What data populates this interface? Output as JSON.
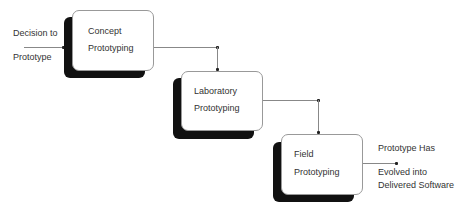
{
  "diagram": {
    "input_label_line1": "Decision to",
    "input_label_line2": "Prototype",
    "stages": [
      {
        "line1": "Concept",
        "line2": "Prototyping"
      },
      {
        "line1": "Laboratory",
        "line2": "Prototyping"
      },
      {
        "line1": "Field",
        "line2": "Prototyping"
      }
    ],
    "output_label_line1": "Prototype Has",
    "output_label_line2": "Evolved into",
    "output_label_line3": "Delivered Software"
  }
}
